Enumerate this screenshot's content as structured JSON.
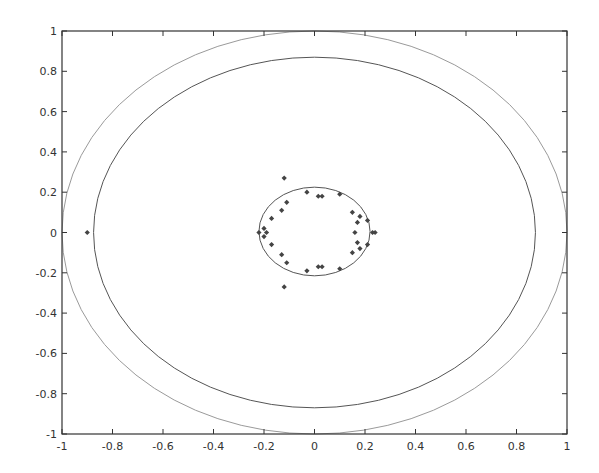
{
  "chart_data": {
    "type": "scatter",
    "title": "",
    "xlabel": "",
    "ylabel": "",
    "xlim": [
      -1,
      1
    ],
    "ylim": [
      -1,
      1
    ],
    "grid": false,
    "legend": null,
    "xticks": [
      "-1",
      "-0.8",
      "-0.6",
      "-0.4",
      "-0.2",
      "0",
      "0.2",
      "0.4",
      "0.6",
      "0.8",
      "1"
    ],
    "yticks": [
      "1",
      "0.8",
      "0.6",
      "0.4",
      "0.2",
      "0",
      "-0.2",
      "-0.4",
      "-0.6",
      "-0.8",
      "-1"
    ],
    "curves": [
      {
        "name": "outer-circle",
        "type": "ellipse",
        "cx": 0,
        "cy": 0,
        "rx": 1.0,
        "ry": 1.0,
        "color": "#9a9a9a"
      },
      {
        "name": "middle-circle",
        "type": "ellipse",
        "cx": 0,
        "cy": 0,
        "rx": 0.875,
        "ry": 0.87,
        "color": "#555555"
      },
      {
        "name": "inner-circle",
        "type": "ellipse",
        "cx": 0,
        "cy": 0.005,
        "rx": 0.22,
        "ry": 0.22,
        "color": "#555555"
      }
    ],
    "series": [
      {
        "name": "points",
        "marker": "diamond",
        "color": "#444444",
        "points": [
          [
            -0.9,
            0.0
          ],
          [
            -0.12,
            0.27
          ],
          [
            -0.12,
            -0.27
          ],
          [
            -0.03,
            0.2
          ],
          [
            0.015,
            0.18
          ],
          [
            0.03,
            0.18
          ],
          [
            0.1,
            0.19
          ],
          [
            -0.11,
            0.15
          ],
          [
            -0.13,
            0.11
          ],
          [
            -0.17,
            0.07
          ],
          [
            -0.2,
            0.02
          ],
          [
            -0.19,
            0.0
          ],
          [
            -0.22,
            0.0
          ],
          [
            -0.2,
            -0.02
          ],
          [
            -0.17,
            -0.06
          ],
          [
            -0.13,
            -0.11
          ],
          [
            -0.11,
            -0.15
          ],
          [
            -0.03,
            -0.19
          ],
          [
            0.015,
            -0.17
          ],
          [
            0.03,
            -0.17
          ],
          [
            0.1,
            -0.18
          ],
          [
            0.15,
            0.1
          ],
          [
            0.18,
            0.08
          ],
          [
            0.17,
            0.05
          ],
          [
            0.21,
            0.06
          ],
          [
            0.16,
            0.0
          ],
          [
            0.23,
            0.0
          ],
          [
            0.24,
            0.0
          ],
          [
            0.17,
            -0.05
          ],
          [
            0.18,
            -0.08
          ],
          [
            0.21,
            -0.06
          ],
          [
            0.15,
            -0.1
          ]
        ]
      }
    ]
  }
}
